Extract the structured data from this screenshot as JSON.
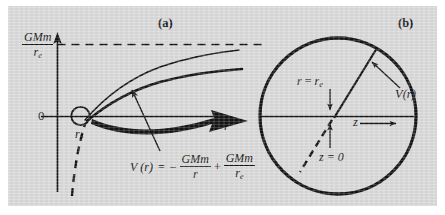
{
  "figure": {
    "panel_a_tag": "(a)",
    "panel_b_tag": "(b)",
    "background_color": "#d9d9d9",
    "ink_color": "#141414"
  },
  "panel_a": {
    "yaxis_label": {
      "numerator": "GMm",
      "denominator": "r",
      "denominator_sub": "e"
    },
    "zero_label": "0",
    "xaxis_label": "r",
    "re_label": {
      "symbol": "r",
      "sub": "e"
    },
    "equation": {
      "lhs_func": "V",
      "lhs_arg": "(r)",
      "equals": "=",
      "minus": "−",
      "term1": {
        "numerator": "GMm",
        "denominator": "r"
      },
      "plus": "+",
      "term2": {
        "numerator": "GMm",
        "denominator": "r",
        "denominator_sub": "e"
      },
      "full_text": "V(r) = −GMm/r + GMm/r_e"
    }
  },
  "panel_b": {
    "r_equals_re": {
      "lhs": "r",
      "equals": "=",
      "rhs": "r",
      "rhs_sub": "e"
    },
    "z_equals_zero": "z = 0",
    "z_axis_label": "z",
    "potential_label": "V(r)"
  }
}
